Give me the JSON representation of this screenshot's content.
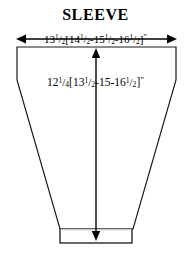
{
  "document": {
    "type": "garment-schematic",
    "title": "SLEEVE",
    "background_color": "#ffffff",
    "ink_color": "#000000"
  },
  "measurements": {
    "upper_arm_width": {
      "label_plain": "13 1/2 [14 1/2 - 15 1/2 - 16 1/2]\"",
      "base": {
        "whole": "13",
        "numerator": "1",
        "denominator": "2"
      },
      "open_bracket": "[",
      "alternates": [
        {
          "whole": "14",
          "numerator": "1",
          "denominator": "2"
        },
        {
          "whole": "15",
          "numerator": "1",
          "denominator": "2"
        },
        {
          "whole": "16",
          "numerator": "1",
          "denominator": "2"
        }
      ],
      "separator": "-",
      "close_bracket": "]",
      "unit": "\"",
      "orientation": "horizontal",
      "arrow_style": "double-headed"
    },
    "sleeve_length": {
      "label_plain": "12 1/4 [13 1/2 - 15 - 16 1/2]\"",
      "base": {
        "whole": "12",
        "numerator": "1",
        "denominator": "4"
      },
      "open_bracket": "[",
      "alternates": [
        {
          "whole": "13",
          "numerator": "1",
          "denominator": "2"
        },
        {
          "whole": "15",
          "numerator": "",
          "denominator": ""
        },
        {
          "whole": "16",
          "numerator": "1",
          "denominator": "2"
        }
      ],
      "separator": "-",
      "close_bracket": "]",
      "unit": "\"",
      "orientation": "vertical",
      "arrow_style": "double-headed"
    }
  },
  "shape": {
    "name": "sleeve-outline",
    "description": "tapered trapezoid with straight upper sides and a cuff band at the hem",
    "stroke_color": "#1a1a1a",
    "stroke_width": 1.2,
    "fill": "none",
    "body_points": "17,47 176,47 176,80 133,229 60,229 17,80",
    "cuff_points": "60,229 132,229 132,243 60,243",
    "cuff_divider_color": "#c8c8c8"
  },
  "annotations": {
    "width_arrow": {
      "name": "width-dimension-arrow",
      "x1": 17,
      "x2": 176,
      "y": 39
    },
    "length_arrow": {
      "name": "length-dimension-arrow",
      "x": 96,
      "y1": 50,
      "y2": 240
    }
  }
}
